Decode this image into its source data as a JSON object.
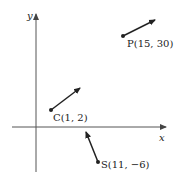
{
  "axes": {
    "x_label": "x",
    "y_label": "y"
  },
  "points": [
    {
      "name": "P",
      "label": "P(15, 30)",
      "x": 15,
      "y": 30
    },
    {
      "name": "C",
      "label": "C(1, 2)",
      "x": 1,
      "y": 2
    },
    {
      "name": "S",
      "label": "S(11, −6)",
      "x": 11,
      "y": -6
    }
  ],
  "colors": {
    "ink": "#222222",
    "axis": "#555555",
    "background": "#ffffff"
  }
}
